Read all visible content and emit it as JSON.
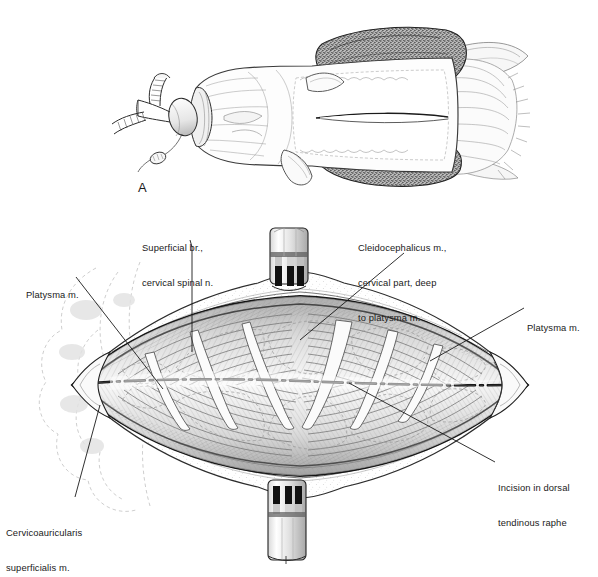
{
  "figure": {
    "kind": "anatomical-illustration",
    "medium": "pen-and-ink line and stipple drawing, grayscale",
    "panels": [
      {
        "id": "A",
        "letter": "A",
        "caption": "",
        "description": "Dog positioned in sternal recumbency, head to the left, with endotracheal tube and anesthetic Y-piece connector; neck clipped and draped; proposed dorsal midline skin incision indicated on the clipped field."
      },
      {
        "id": "B",
        "letter": "",
        "caption": "",
        "description": "Surgical exposure of the dorsal cervical region after skin incision and retraction, showing platysma, cleidocephalicus muscle cervical part, superficial branches of cervical spinal nerves, cervicoauricularis superficialis muscle, and the dorsal tendinous raphe incision line."
      }
    ]
  },
  "panel_letters": [
    {
      "name": "panel-a-letter",
      "text": "A",
      "x": 138,
      "y": 180
    }
  ],
  "labels": [
    {
      "id": "superficial-branch",
      "lines": [
        "Superficial br.,",
        "cervical spinal n."
      ],
      "x": 142,
      "y": 219,
      "align": "left"
    },
    {
      "id": "cleidocephalicus",
      "lines": [
        "Cleidocephalicus m.,",
        "cervical part, deep",
        "to platysma m."
      ],
      "x": 358,
      "y": 219,
      "align": "left"
    },
    {
      "id": "platysma-left",
      "lines": [
        "Platysma m."
      ],
      "x": 26,
      "y": 266,
      "align": "left"
    },
    {
      "id": "platysma-right",
      "lines": [
        "Platysma m."
      ],
      "x": 527,
      "y": 299,
      "align": "left"
    },
    {
      "id": "incision-raphe",
      "lines": [
        "Incision in dorsal",
        "tendinous raphe"
      ],
      "x": 498,
      "y": 459,
      "align": "left"
    },
    {
      "id": "cervicoauricularis",
      "lines": [
        "Cervicoauricularis",
        "superficialis m."
      ],
      "x": 6,
      "y": 504,
      "align": "left"
    }
  ],
  "leaders": [
    {
      "id": "leader-superficial-branch",
      "points": "190,240 192,247 192,352"
    },
    {
      "id": "leader-cleidocephalicus",
      "points": "404,253 300,340"
    },
    {
      "id": "leader-platysma-left",
      "points": "76,277 163,389"
    },
    {
      "id": "leader-platysma-right",
      "points": "524,308 430,361"
    },
    {
      "id": "leader-incision-raphe",
      "points": "495,462 349,383"
    },
    {
      "id": "leader-cervicoauricularis",
      "points": "75,497 100,405"
    }
  ],
  "colors": {
    "ink": "#1a1a1a",
    "line": "#2b2b2b",
    "mid_gray": "#8a8a8a",
    "light_gray": "#c9c9c9",
    "very_light": "#e8e8e8",
    "paper": "#ffffff",
    "drape_dark": "#4a4a4a",
    "fur_shadow": "#9a9a9a"
  },
  "annotated_structures": {
    "panel_b": [
      "Platysma m. (left/cranial edge)",
      "Platysma m. (right/caudal edge)",
      "Superficial br., cervical spinal n.",
      "Cleidocephalicus m., cervical part, deep to platysma m.",
      "Cervicoauricularis superficialis m.",
      "Incision in dorsal tendinous raphe"
    ],
    "panel_a": [
      "Endotracheal tube",
      "Y-piece anesthetic connector",
      "Surgical drapes",
      "Clipped surgical field",
      "Proposed skin incision"
    ]
  },
  "graphic_elements": {
    "towel_clamps": 2,
    "dash_dot_incision_line": true,
    "stipple_shading": true,
    "dashed_outline_muscle_margins": true
  }
}
